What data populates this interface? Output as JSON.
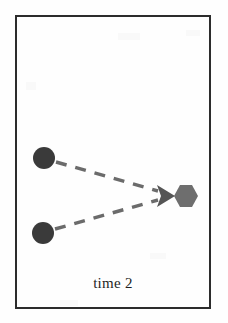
{
  "figure": {
    "caption": "time 2",
    "width": 228,
    "height": 323,
    "background_color": "#fefefe",
    "border_color": "#2c2c2c"
  },
  "diagram_data": {
    "type": "diagram",
    "description": "Two dark circular agents at left connected by dashed trajectory lines converging to a rightward arrowhead aimed at a gray hexagon target",
    "frame": {
      "x": 15,
      "y": 15,
      "width": 196,
      "height": 294,
      "stroke_width": 2,
      "color": "#2c2c2c"
    },
    "nodes": [
      {
        "id": "agent-top",
        "shape": "circle",
        "label": "",
        "cx": 44,
        "cy": 158,
        "r": 11,
        "color": "#3a3a3a"
      },
      {
        "id": "agent-bottom",
        "shape": "circle",
        "label": "",
        "cx": 43,
        "cy": 233,
        "r": 11,
        "color": "#3a3a3a"
      },
      {
        "id": "target",
        "shape": "hexagon",
        "label": "",
        "cx": 186,
        "cy": 196,
        "r": 12,
        "color": "#6e6e6e"
      }
    ],
    "edges": [
      {
        "id": "edge-top",
        "from": "agent-top",
        "to": "target",
        "style": "dashed",
        "color": "#6b6b6b",
        "x1": 56,
        "y1": 162,
        "x2": 158,
        "y2": 191
      },
      {
        "id": "edge-bottom",
        "from": "agent-bottom",
        "to": "target",
        "style": "dashed",
        "color": "#6b6b6b",
        "x1": 55,
        "y1": 229,
        "x2": 158,
        "y2": 200
      }
    ],
    "arrowhead": {
      "id": "convergence-arrow",
      "direction": "right",
      "tip_x": 175,
      "tip_y": 196,
      "color": "#555555"
    }
  }
}
